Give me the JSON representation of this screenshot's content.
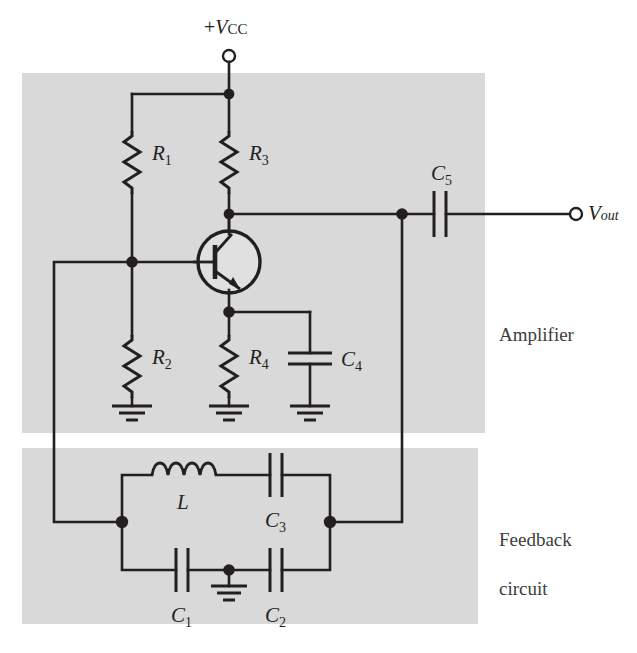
{
  "figure": {
    "kind": "circuit-diagram",
    "title_visible": false,
    "background_color": "#ffffff",
    "ink_color": "#231f20",
    "panel_color": "#d9d9d9"
  },
  "panels": [
    {
      "name": "amplifier",
      "label": "Amplifier",
      "x": 22,
      "y": 73,
      "width": 463,
      "height": 360
    },
    {
      "name": "feedback",
      "label": "Feedback\ncircuit",
      "label_line1": "Feedback",
      "label_line2": "circuit",
      "x": 22,
      "y": 448,
      "width": 456,
      "height": 176
    }
  ],
  "terminals": [
    {
      "name": "supply",
      "label_prefix": "+",
      "label_symbol": "V",
      "label_sub": "CC",
      "label_full": "+VCC"
    },
    {
      "name": "output",
      "label_symbol": "V",
      "label_sub": "out",
      "label_full": "Vout"
    }
  ],
  "components": [
    {
      "id": "R1",
      "type": "resistor",
      "letter": "R",
      "sub": "1"
    },
    {
      "id": "R2",
      "type": "resistor",
      "letter": "R",
      "sub": "2"
    },
    {
      "id": "R3",
      "type": "resistor",
      "letter": "R",
      "sub": "3"
    },
    {
      "id": "R4",
      "type": "resistor",
      "letter": "R",
      "sub": "4"
    },
    {
      "id": "C1",
      "type": "capacitor",
      "letter": "C",
      "sub": "1"
    },
    {
      "id": "C2",
      "type": "capacitor",
      "letter": "C",
      "sub": "2"
    },
    {
      "id": "C3",
      "type": "capacitor",
      "letter": "C",
      "sub": "3"
    },
    {
      "id": "C4",
      "type": "capacitor",
      "letter": "C",
      "sub": "4"
    },
    {
      "id": "C5",
      "type": "capacitor",
      "letter": "C",
      "sub": "5"
    },
    {
      "id": "L",
      "type": "inductor",
      "letter": "L",
      "sub": ""
    },
    {
      "id": "Q1",
      "type": "transistor-npn",
      "letter": "",
      "sub": ""
    }
  ],
  "grounds": [
    {
      "name": "ground-r2"
    },
    {
      "name": "ground-r4"
    },
    {
      "name": "ground-c4"
    },
    {
      "name": "ground-feedback"
    }
  ],
  "labels": {
    "R1": "R",
    "R1_sub": "1",
    "R2": "R",
    "R2_sub": "2",
    "R3": "R",
    "R3_sub": "3",
    "R4": "R",
    "R4_sub": "4",
    "C1": "C",
    "C1_sub": "1",
    "C2": "C",
    "C2_sub": "2",
    "C3": "C",
    "C3_sub": "3",
    "C4": "C",
    "C4_sub": "4",
    "C5": "C",
    "C5_sub": "5",
    "L": "L",
    "vcc_sign": "+",
    "vcc_v": "V",
    "vcc_sub": "CC",
    "vout_v": "V",
    "vout_sub": "out",
    "amplifier": "Amplifier",
    "feedback_line1": "Feedback",
    "feedback_line2": "circuit"
  }
}
